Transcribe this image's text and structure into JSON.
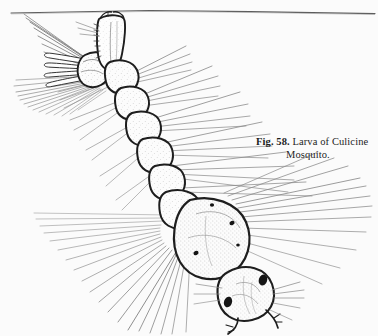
{
  "figure": {
    "caption_number": "Fig. 58.",
    "caption_text": "Larva of Culicine",
    "caption_text_line2": "Mosquito.",
    "caption_full": "Fig. 58. Larva of Culicine Mosquito.",
    "style": "pen-and-ink scientific line drawing, stippled shading",
    "colors": {
      "background": "#fbfbfb",
      "ink": "#1d1d1d",
      "hair_light": "#8a8a8a",
      "stipple": "#555555",
      "eye": "#151515"
    },
    "parts": [
      {
        "name": "water-surface-line",
        "label": "water surface"
      },
      {
        "name": "siphon",
        "label": "respiratory siphon"
      },
      {
        "name": "anal-segment",
        "label": "anal segment"
      },
      {
        "name": "anal-gills",
        "label": "anal gills",
        "count": 4
      },
      {
        "name": "caudal-brush",
        "label": "caudal hair brush"
      },
      {
        "name": "abdomen",
        "label": "abdomen",
        "segments": 8
      },
      {
        "name": "thorax",
        "label": "thorax"
      },
      {
        "name": "head",
        "label": "head capsule"
      },
      {
        "name": "eye",
        "label": "compound eye",
        "count": 2
      },
      {
        "name": "antenna",
        "label": "antenna",
        "count": 2
      },
      {
        "name": "mouth-brush",
        "label": "mouth brushes"
      }
    ]
  }
}
